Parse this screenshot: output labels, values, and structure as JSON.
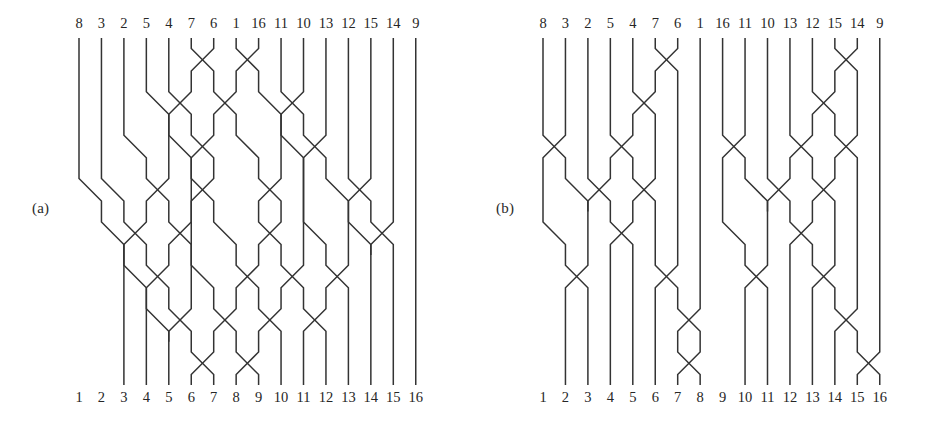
{
  "figure": {
    "type": "permutation-network-diagram",
    "background_color": "#ffffff",
    "line_color": "#333333",
    "text_color": "#262626",
    "width": 928,
    "height": 421
  },
  "panels": [
    {
      "id": "a",
      "caption": "(a)",
      "network_type": "benes",
      "wire_count": 16,
      "top_labels": [
        "8",
        "3",
        "2",
        "5",
        "4",
        "7",
        "6",
        "1",
        "16",
        "11",
        "10",
        "13",
        "12",
        "15",
        "14",
        "9"
      ],
      "bottom_labels": [
        "1",
        "2",
        "3",
        "4",
        "5",
        "6",
        "7",
        "8",
        "9",
        "10",
        "11",
        "12",
        "13",
        "14",
        "15",
        "16"
      ],
      "geometry": {
        "x_first": 79,
        "x_step": 22.45,
        "y_top": 38,
        "y_bottom": 385,
        "stages": 8
      },
      "stage_swaps": [
        [
          [
            6,
            7
          ],
          [
            8,
            9
          ]
        ],
        [
          [
            4,
            5
          ],
          [
            5,
            6
          ],
          [
            7,
            8
          ],
          [
            9,
            10
          ],
          [
            10,
            11
          ]
        ],
        [
          [
            3,
            4
          ],
          [
            5,
            6
          ],
          [
            6,
            7
          ],
          [
            8,
            9
          ],
          [
            10,
            11
          ],
          [
            11,
            12
          ]
        ],
        [
          [
            1,
            2
          ],
          [
            2,
            3
          ],
          [
            4,
            5
          ],
          [
            6,
            7
          ],
          [
            8,
            9
          ],
          [
            9,
            10
          ],
          [
            12,
            13
          ],
          [
            13,
            14
          ]
        ],
        [
          [
            2,
            3
          ],
          [
            3,
            4
          ],
          [
            5,
            6
          ],
          [
            7,
            8
          ],
          [
            9,
            10
          ],
          [
            11,
            12
          ],
          [
            13,
            14
          ],
          [
            14,
            15
          ]
        ],
        [
          [
            3,
            4
          ],
          [
            4,
            5
          ],
          [
            6,
            7
          ],
          [
            8,
            9
          ],
          [
            10,
            11
          ],
          [
            12,
            13
          ]
        ],
        [
          [
            4,
            5
          ],
          [
            5,
            6
          ],
          [
            7,
            8
          ],
          [
            9,
            10
          ],
          [
            11,
            12
          ]
        ],
        [
          [
            6,
            7
          ],
          [
            8,
            9
          ]
        ]
      ]
    },
    {
      "id": "b",
      "caption": "(b)",
      "network_type": "benes-split-halves",
      "wire_count": 16,
      "top_labels": [
        "8",
        "3",
        "2",
        "5",
        "4",
        "7",
        "6",
        "1",
        "16",
        "11",
        "10",
        "13",
        "12",
        "15",
        "14",
        "9"
      ],
      "bottom_labels": [
        "1",
        "2",
        "3",
        "4",
        "5",
        "6",
        "7",
        "8",
        "9",
        "10",
        "11",
        "12",
        "13",
        "14",
        "15",
        "16"
      ],
      "geometry": {
        "x_first": 79,
        "x_step": 22.45,
        "y_top": 38,
        "y_bottom": 385,
        "stages": 8
      },
      "stage_swaps": [
        [
          [
            6,
            7
          ],
          [
            14,
            15
          ]
        ],
        [
          [
            5,
            6
          ],
          [
            13,
            14
          ]
        ],
        [
          [
            1,
            2
          ],
          [
            4,
            5
          ],
          [
            9,
            10
          ],
          [
            12,
            13
          ],
          [
            14,
            15
          ]
        ],
        [
          [
            2,
            3
          ],
          [
            3,
            4
          ],
          [
            5,
            6
          ],
          [
            10,
            11
          ],
          [
            11,
            12
          ],
          [
            13,
            14
          ]
        ],
        [
          [
            1,
            2
          ],
          [
            4,
            5
          ],
          [
            9,
            10
          ],
          [
            12,
            13
          ]
        ],
        [
          [
            2,
            3
          ],
          [
            6,
            7
          ],
          [
            10,
            11
          ],
          [
            13,
            14
          ]
        ],
        [
          [
            7,
            8
          ],
          [
            14,
            15
          ]
        ],
        [
          [
            7,
            8
          ],
          [
            15,
            16
          ]
        ]
      ]
    }
  ]
}
